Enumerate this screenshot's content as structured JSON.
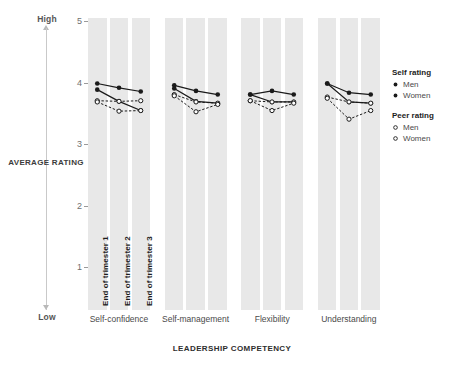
{
  "axes": {
    "y_title": "AVERAGE RATING",
    "x_title": "LEADERSHIP COMPETENCY",
    "high_label": "High",
    "low_label": "Low",
    "y_ticks": [
      "5",
      "4",
      "3",
      "2",
      "1"
    ]
  },
  "legend": {
    "groups": [
      {
        "title": "Self rating",
        "items": [
          {
            "label": "Men",
            "marker": "filled-circle-icon",
            "color": "#1a1a1a"
          },
          {
            "label": "Women",
            "marker": "filled-circle-icon",
            "color": "#1a1a1a"
          }
        ]
      },
      {
        "title": "Peer rating",
        "items": [
          {
            "label": "Men",
            "marker": "open-circle-icon",
            "color": "#1a1a1a"
          },
          {
            "label": "Women",
            "marker": "open-circle-icon",
            "color": "#1a1a1a"
          }
        ]
      }
    ]
  },
  "trimesters": [
    "End of trimester 1",
    "End of trimester 2",
    "End of trimester 3"
  ],
  "chart_data": {
    "type": "line",
    "title": "",
    "xlabel": "LEADERSHIP COMPETENCY",
    "ylabel": "AVERAGE RATING",
    "ylim": [
      0.6,
      5.25
    ],
    "yticks": [
      1,
      2,
      3,
      4,
      5
    ],
    "grid": false,
    "legend_position": "right",
    "x": [
      "End of trimester 1",
      "End of trimester 2",
      "End of trimester 3"
    ],
    "categories": [
      "Self-confidence",
      "Self-management",
      "Flexibility",
      "Understanding"
    ],
    "panels": [
      {
        "category": "Self-confidence",
        "series": [
          {
            "name": "Self rating Men",
            "style": "solid",
            "marker": "filled",
            "values": [
              4.0,
              3.93,
              3.87
            ]
          },
          {
            "name": "Self rating Women",
            "style": "solid",
            "marker": "filled",
            "values": [
              3.9,
              3.71,
              3.56
            ]
          },
          {
            "name": "Peer rating Men",
            "style": "dashed",
            "marker": "open",
            "values": [
              3.72,
              3.71,
              3.72
            ]
          },
          {
            "name": "Peer rating Women",
            "style": "dashed",
            "marker": "open",
            "values": [
              3.7,
              3.55,
              3.56
            ]
          }
        ]
      },
      {
        "category": "Self-management",
        "series": [
          {
            "name": "Self rating Men",
            "style": "solid",
            "marker": "filled",
            "values": [
              3.97,
              3.88,
              3.82
            ]
          },
          {
            "name": "Self rating Women",
            "style": "solid",
            "marker": "filled",
            "values": [
              3.92,
              3.71,
              3.68
            ]
          },
          {
            "name": "Peer rating Men",
            "style": "dashed",
            "marker": "open",
            "values": [
              3.82,
              3.7,
              3.68
            ]
          },
          {
            "name": "Peer rating Women",
            "style": "dashed",
            "marker": "open",
            "values": [
              3.8,
              3.54,
              3.66
            ]
          }
        ]
      },
      {
        "category": "Flexibility",
        "series": [
          {
            "name": "Self rating Men",
            "style": "solid",
            "marker": "filled",
            "values": [
              3.82,
              3.88,
              3.82
            ]
          },
          {
            "name": "Self rating Women",
            "style": "solid",
            "marker": "filled",
            "values": [
              3.82,
              3.7,
              3.7
            ]
          },
          {
            "name": "Peer rating Men",
            "style": "dashed",
            "marker": "open",
            "values": [
              3.72,
              3.7,
              3.7
            ]
          },
          {
            "name": "Peer rating Women",
            "style": "dashed",
            "marker": "open",
            "values": [
              3.72,
              3.56,
              3.68
            ]
          }
        ]
      },
      {
        "category": "Understanding",
        "series": [
          {
            "name": "Self rating Men",
            "style": "solid",
            "marker": "filled",
            "values": [
              4.0,
              3.85,
              3.82
            ]
          },
          {
            "name": "Self rating Women",
            "style": "solid",
            "marker": "filled",
            "values": [
              4.0,
              3.7,
              3.68
            ]
          },
          {
            "name": "Peer rating Men",
            "style": "dashed",
            "marker": "open",
            "values": [
              3.78,
              3.7,
              3.68
            ]
          },
          {
            "name": "Peer rating Women",
            "style": "dashed",
            "marker": "open",
            "values": [
              3.76,
              3.42,
              3.56
            ]
          }
        ]
      }
    ]
  }
}
